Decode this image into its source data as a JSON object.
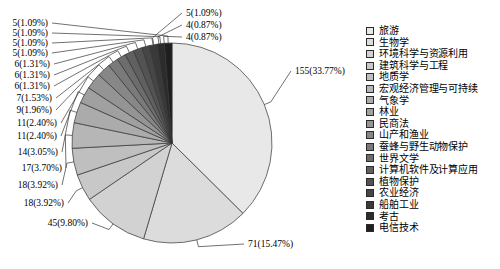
{
  "chart_data": {
    "type": "pie",
    "title": "",
    "subtitle": "",
    "xlabel": "",
    "ylabel": "",
    "legend_position": "right",
    "grid": false,
    "start_angle_deg": 0,
    "direction": "clockwise",
    "total": 459,
    "categories": [
      "旅游",
      "生物学",
      "环境科学与资源利用",
      "建筑科学与工程",
      "地质学",
      "宏观经济管理与可持续",
      "气象学",
      "林业",
      "民商法",
      "山产和渔业",
      "蚕蜂与野生动物保护",
      "世界文学",
      "计算机软件及计算应用",
      "植物保护",
      "农业经济",
      "船舶工业",
      "考古",
      "电信技术"
    ],
    "values": [
      155,
      71,
      45,
      18,
      18,
      17,
      14,
      11,
      11,
      9,
      7,
      6,
      6,
      6,
      5,
      5,
      5,
      5
    ],
    "percents": [
      33.77,
      15.47,
      9.8,
      3.92,
      3.92,
      3.7,
      3.05,
      2.4,
      2.4,
      1.96,
      1.53,
      1.31,
      1.31,
      1.31,
      1.09,
      1.09,
      1.09,
      1.09
    ],
    "slice_fills": [
      "#e8e8e8",
      "#dcdcdc",
      "#d2d2d2",
      "#c8c8c8",
      "#bfbfbf",
      "#b6b6b6",
      "#ababab",
      "#a0a0a0",
      "#949494",
      "#878787",
      "#7a7a7a",
      "#6d6d6d",
      "#606060",
      "#535353",
      "#464646",
      "#393939",
      "#2c2c2c",
      "#1f1f1f"
    ],
    "labels": [
      {
        "text": "155(33.77%)",
        "value": 155,
        "percent": 33.77,
        "side": "right"
      },
      {
        "text": "71(15.47%)",
        "value": 71,
        "percent": 15.47,
        "side": "right"
      },
      {
        "text": "45(9.80%)",
        "value": 45,
        "percent": 9.8,
        "side": "left"
      },
      {
        "text": "18(3.92%)",
        "value": 18,
        "percent": 3.92,
        "side": "left"
      },
      {
        "text": "18(3.92%)",
        "value": 18,
        "percent": 3.92,
        "side": "left"
      },
      {
        "text": "17(3.70%)",
        "value": 17,
        "percent": 3.7,
        "side": "left"
      },
      {
        "text": "14(3.05%)",
        "value": 14,
        "percent": 3.05,
        "side": "left"
      },
      {
        "text": "11(2.40%)",
        "value": 11,
        "percent": 2.4,
        "side": "left"
      },
      {
        "text": "11(2.40%)",
        "value": 11,
        "percent": 2.4,
        "side": "left"
      },
      {
        "text": "9(1.96%)",
        "value": 9,
        "percent": 1.96,
        "side": "left"
      },
      {
        "text": "7(1.53%)",
        "value": 7,
        "percent": 1.53,
        "side": "left"
      },
      {
        "text": "6(1.31%)",
        "value": 6,
        "percent": 1.31,
        "side": "left"
      },
      {
        "text": "6(1.31%)",
        "value": 6,
        "percent": 1.31,
        "side": "left"
      },
      {
        "text": "6(1.31%)",
        "value": 6,
        "percent": 1.31,
        "side": "left"
      },
      {
        "text": "5(1.09%)",
        "value": 5,
        "percent": 1.09,
        "side": "left"
      },
      {
        "text": "5(1.09%)",
        "value": 5,
        "percent": 1.09,
        "side": "left"
      },
      {
        "text": "5(1.09%)",
        "value": 5,
        "percent": 1.09,
        "side": "left"
      },
      {
        "text": "5(1.09%)",
        "value": 5,
        "percent": 1.09,
        "side": "left"
      },
      {
        "text": "5(1.09%)",
        "value": 5,
        "percent": 1.09,
        "side": "left"
      },
      {
        "text": "4(0.87%)",
        "value": 4,
        "percent": 0.87,
        "side": "top"
      },
      {
        "text": "4(0.87%)",
        "value": 4,
        "percent": 0.87,
        "side": "top"
      },
      {
        "text": "4(0.87%)",
        "value": 4,
        "percent": 0.87,
        "side": "top"
      }
    ],
    "colors": {
      "outline": "#333333",
      "leader_line": "#333333",
      "text": "#000000",
      "background": "#ffffff"
    }
  },
  "legend": {
    "items": [
      {
        "label": "旅游"
      },
      {
        "label": "生物学"
      },
      {
        "label": "环境科学与资源利用"
      },
      {
        "label": "建筑科学与工程"
      },
      {
        "label": "地质学"
      },
      {
        "label": "宏观经济管理与可持续"
      },
      {
        "label": "气象学"
      },
      {
        "label": "林业"
      },
      {
        "label": "民商法"
      },
      {
        "label": "山产和渔业"
      },
      {
        "label": "蚕蜂与野生动物保护"
      },
      {
        "label": "世界文学"
      },
      {
        "label": "计算机软件及计算应用"
      },
      {
        "label": "植物保护"
      },
      {
        "label": "农业经济"
      },
      {
        "label": "船舶工业"
      },
      {
        "label": "考古"
      },
      {
        "label": "电信技术"
      }
    ]
  }
}
